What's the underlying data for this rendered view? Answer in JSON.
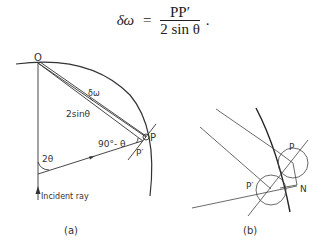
{
  "formula": {
    "lhs": "δω",
    "equals": "=",
    "numerator": "PP′",
    "denominator": "2 sin θ",
    "trailing": "."
  },
  "diagram_a": {
    "caption": "(a)",
    "labels": {
      "origin": "O",
      "point_p": "P",
      "point_p_prime": "P′",
      "delta_omega": "δω",
      "chord_length": "2sinθ",
      "angle_complement": "90°- θ",
      "angle_two_theta": "2θ",
      "incident_ray": "Incident ray"
    }
  },
  "diagram_b": {
    "caption": "(b)",
    "labels": {
      "point_p": "P",
      "point_p_prime": "P′",
      "point_n": "N"
    }
  }
}
